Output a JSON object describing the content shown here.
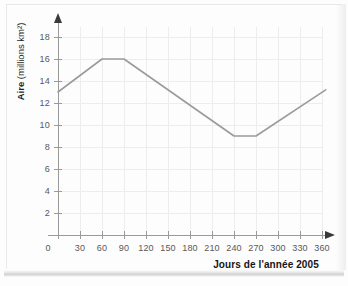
{
  "chart_data": {
    "type": "line",
    "title": "",
    "xlabel": "Jours de l'année 2005",
    "ylabel": "Aire (millions km²)",
    "ylabel_lead": "Aire",
    "ylabel_rest": " (millions km²)",
    "xlim": [
      0,
      372
    ],
    "ylim": [
      0,
      19
    ],
    "grid": true,
    "legend": "none",
    "x_ticks": [
      0,
      30,
      60,
      90,
      120,
      150,
      180,
      210,
      240,
      270,
      300,
      330,
      360
    ],
    "x_ticklabels": [
      "0",
      "30",
      "60",
      "90",
      "120",
      "150",
      "180",
      "210",
      "240",
      "270",
      "300",
      "330",
      "360"
    ],
    "y_ticks": [
      2,
      4,
      6,
      8,
      10,
      12,
      14,
      16,
      18
    ],
    "y_ticklabels": [
      "2",
      "4",
      "6",
      "8",
      "10",
      "12",
      "14",
      "16",
      "18"
    ],
    "series": [
      {
        "name": "Aire de la banquise",
        "color": "#9b9b9b",
        "x": [
          0,
          60,
          90,
          240,
          270,
          365
        ],
        "values": [
          13,
          16,
          16,
          9,
          9,
          13.2
        ]
      }
    ]
  },
  "colors": {
    "line": "#9b9b9b",
    "grid": "#ededed",
    "axis": "#9a9a9a",
    "arrow": "#3a3a3a",
    "tick_text": "#58585a",
    "label_text": "#161616",
    "background": "#fdfdfd"
  }
}
